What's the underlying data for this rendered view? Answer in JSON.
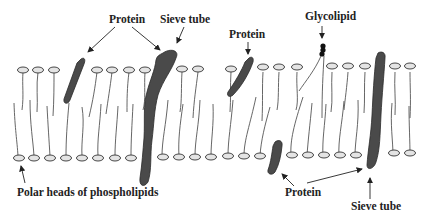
{
  "diagram": {
    "labels": [
      {
        "id": "protein-top-left",
        "text": "Protein",
        "x": 109,
        "y": 14
      },
      {
        "id": "sieve-tube-top",
        "text": "Sieve tube",
        "x": 160,
        "y": 14
      },
      {
        "id": "glycolipid",
        "text": "Glycolipid",
        "x": 305,
        "y": 11
      },
      {
        "id": "protein-top-right",
        "text": "Protein",
        "x": 229,
        "y": 29
      },
      {
        "id": "polar-heads",
        "text": "Polar heads of phospholipids",
        "x": 17,
        "y": 191
      },
      {
        "id": "protein-bottom",
        "text": "Protein",
        "x": 285,
        "y": 187
      },
      {
        "id": "sieve-tube-bottom",
        "text": "Sieve tube",
        "x": 351,
        "y": 201
      }
    ],
    "colors": {
      "protein_fill": "#4a4a4a",
      "protein_stroke": "#2a2a2a",
      "head_fill": "#e4e4e4",
      "head_stroke": "#333333",
      "tail": "#555555",
      "arrow": "#222222"
    },
    "top_heads_x": [
      23,
      38,
      54,
      97,
      112,
      129,
      145,
      182,
      198,
      215,
      231,
      230,
      246,
      263,
      279,
      297,
      332,
      348,
      365,
      395,
      410
    ],
    "bottom_heads_x": [
      18,
      34,
      50,
      66,
      82,
      98,
      115,
      131,
      162,
      179,
      195,
      211,
      228,
      244,
      260,
      291,
      307,
      323,
      339,
      355,
      393,
      410
    ]
  }
}
